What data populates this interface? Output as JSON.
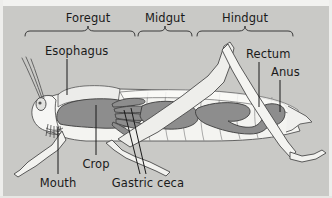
{
  "figure": {
    "background_color": "#c9c9c6",
    "border_color": "#eeeeec",
    "text_color": "#1a1a1a",
    "organ_fill_color": "#8a8a8a",
    "body_fill_color": "#f0f0ec",
    "outline_color": "#4a4a4a"
  },
  "region_labels": [
    {
      "id": "foregut",
      "label": "Foregut",
      "x": 88,
      "y": 12,
      "brace_left": 25,
      "brace_right": 135,
      "brace_y": 31
    },
    {
      "id": "midgut",
      "label": "Midgut",
      "x": 165,
      "y": 12,
      "brace_left": 138,
      "brace_right": 192,
      "brace_y": 31
    },
    {
      "id": "hindgut",
      "label": "Hindgut",
      "x": 245,
      "y": 12,
      "brace_left": 197,
      "brace_right": 293,
      "brace_y": 31
    }
  ],
  "part_labels": [
    {
      "id": "esophagus",
      "label": "Esophagus",
      "x": 45,
      "y": 45,
      "align": "left",
      "leader": {
        "x1": 67,
        "y1": 59,
        "x2": 67,
        "y2": 95
      }
    },
    {
      "id": "rectum",
      "label": "Rectum",
      "x": 246,
      "y": 48,
      "align": "left",
      "leader": {
        "x1": 259,
        "y1": 62,
        "x2": 259,
        "y2": 107
      }
    },
    {
      "id": "anus",
      "label": "Anus",
      "x": 271,
      "y": 66,
      "align": "left",
      "leader": {
        "x1": 280,
        "y1": 80,
        "x2": 280,
        "y2": 112
      }
    },
    {
      "id": "mouth",
      "label": "Mouth",
      "x": 58,
      "y": 178,
      "align": "center",
      "leader": {
        "x1": 58,
        "y1": 176,
        "x2": 58,
        "y2": 127
      }
    },
    {
      "id": "crop",
      "label": "Crop",
      "x": 96,
      "y": 159,
      "align": "center",
      "leader": {
        "x1": 96,
        "y1": 157,
        "x2": 96,
        "y2": 105
      }
    },
    {
      "id": "gastric-ceca",
      "label": "Gastric ceca",
      "x": 148,
      "y": 178,
      "align": "center",
      "leader": {
        "x1": 140,
        "y1": 176,
        "x2": 124,
        "y2": 110
      }
    }
  ]
}
